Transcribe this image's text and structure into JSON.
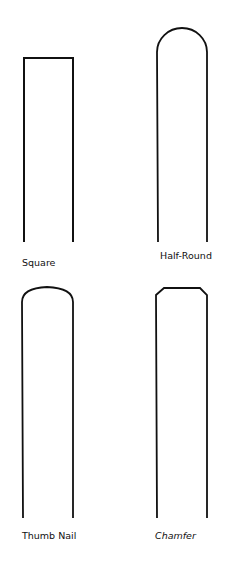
{
  "diagram": {
    "stroke_color": "#111111",
    "background": "#ffffff",
    "profiles": [
      {
        "name": "Square",
        "shape": "square"
      },
      {
        "name": "Half-Round",
        "shape": "half-round"
      },
      {
        "name": "Thumb Nail",
        "shape": "thumb-nail"
      },
      {
        "name": "Chamfer",
        "shape": "chamfer"
      }
    ]
  }
}
